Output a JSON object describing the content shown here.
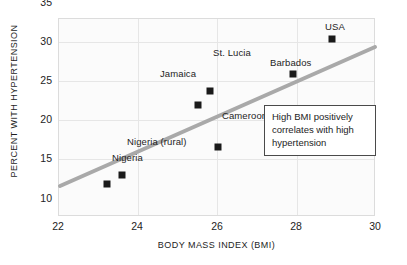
{
  "chart_data": {
    "type": "scatter",
    "title": "",
    "xlabel": "BODY MASS INDEX (BMI)",
    "ylabel": "PERCENT WITH HYPERTENSION",
    "xlim": [
      22,
      30
    ],
    "ylim": [
      10,
      35
    ],
    "xticks": [
      22,
      24,
      26,
      28,
      30
    ],
    "yticks": [
      10,
      15,
      20,
      25,
      30,
      35
    ],
    "grid": true,
    "legend": "none",
    "marker_color": "#1a1a1a",
    "trendline_color": "#a9a9a9",
    "points": [
      {
        "label": "Nigeria",
        "x": 23.2,
        "y": 14.2,
        "label_pos": "below-right"
      },
      {
        "label": "Nigeria (rural)",
        "x": 23.6,
        "y": 15.3,
        "label_pos": "right"
      },
      {
        "label": "Jamaica",
        "x": 25.5,
        "y": 24.1,
        "label_pos": "below-left"
      },
      {
        "label": "St. Lucia",
        "x": 25.8,
        "y": 25.9,
        "label_pos": "right"
      },
      {
        "label": "Cameroon",
        "x": 26.0,
        "y": 18.8,
        "label_pos": "below-right"
      },
      {
        "label": "Barbados",
        "x": 27.9,
        "y": 28.1,
        "label_pos": "above"
      },
      {
        "label": "USA",
        "x": 28.9,
        "y": 32.5,
        "label_pos": "above"
      }
    ],
    "trendline": {
      "x0": 22.0,
      "y0": 13.9,
      "x1": 29.9,
      "y1": 31.5
    },
    "annotation": {
      "text": "High BMI positively correlates with high hypertension",
      "line1": "High BMI positively",
      "line2": "correlates with high",
      "line3": "hypertension"
    }
  },
  "axes": {
    "x_title": "BODY MASS INDEX (BMI)",
    "y_title": "PERCENT WITH HYPERTENSION",
    "x_tick_labels": [
      "22",
      "24",
      "26",
      "28",
      "30"
    ],
    "y_tick_labels": [
      "10",
      "15",
      "20",
      "25",
      "30",
      "35"
    ]
  },
  "points_labels": {
    "0": "Nigeria",
    "1": "Nigeria (rural)",
    "2": "Jamaica",
    "3": "St. Lucia",
    "4": "Cameroon",
    "5": "Barbados",
    "6": "USA"
  }
}
